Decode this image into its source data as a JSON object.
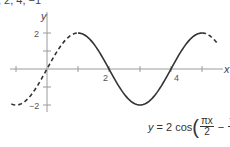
{
  "header": {
    "cut_text": ", 2, 4, −1"
  },
  "chart_data": {
    "type": "line",
    "title": "",
    "xlabel": "x",
    "ylabel": "y",
    "function": "y = 2 cos(πx/2 − π/2)",
    "x_ticks": [
      -1,
      1,
      2,
      3,
      4,
      5
    ],
    "x_tick_labels": [
      {
        "x": 2,
        "label": "2"
      },
      {
        "x": 4,
        "label": "4"
      }
    ],
    "y_ticks": [
      -2,
      -1,
      1,
      2
    ],
    "y_tick_labels": [
      {
        "y": 2,
        "label": "2"
      },
      {
        "y": -2,
        "label": "−2"
      }
    ],
    "xlim": [
      -1.2,
      5.7
    ],
    "ylim": [
      -2.3,
      2.6
    ],
    "series": [
      {
        "name": "solid segment (one period)",
        "style": "solid",
        "x": [
          1,
          2,
          3,
          4,
          5
        ],
        "y": [
          2,
          0,
          -2,
          0,
          2
        ]
      },
      {
        "name": "dashed extension left",
        "style": "dashed",
        "x": [
          -1,
          0,
          1
        ],
        "y": [
          -2,
          0,
          2
        ]
      },
      {
        "name": "dashed extension right",
        "style": "dashed",
        "x": [
          5,
          5.5
        ],
        "y": [
          2,
          1.41
        ]
      }
    ],
    "key_points": [
      {
        "x": -1,
        "y": -2
      },
      {
        "x": 0,
        "y": 0
      },
      {
        "x": 1,
        "y": 2
      },
      {
        "x": 2,
        "y": 0
      },
      {
        "x": 3,
        "y": -2
      },
      {
        "x": 4,
        "y": 0
      },
      {
        "x": 5,
        "y": 2
      }
    ],
    "grid": false,
    "legend": null
  },
  "labels": {
    "x_axis": "x",
    "y_axis": "y",
    "tick_2": "2",
    "tick_4": "4",
    "ytick_2": "2",
    "ytick_neg2": "−2"
  },
  "equation": {
    "lhs": "y",
    "eq": "= 2 cos",
    "frac1_num": "πx",
    "frac1_den": "2",
    "minus": "−",
    "frac2_num": "π",
    "frac2_den": "2",
    "lparen": "(",
    "rparen": ")"
  },
  "colors": {
    "curve": "#333333",
    "axis": "#999999"
  }
}
